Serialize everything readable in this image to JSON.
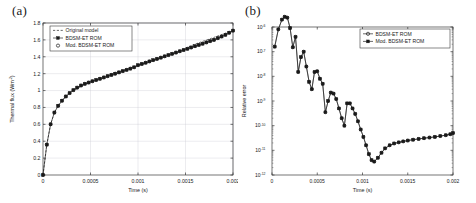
{
  "figure": {
    "panels": [
      {
        "id": "a",
        "label": "(a)",
        "xlabel": "Time (s)",
        "ylabel": "Thermal flux (Wm",
        "ylabel_sup": "-2",
        "ylabel_suffix": ")",
        "xticks": [
          "0",
          "0.0005",
          "0.001",
          "0.0015",
          "0.002"
        ],
        "yticks": [
          "0",
          "0.2",
          "0.4",
          "0.6",
          "0.8",
          "1",
          "1.2",
          "1.4",
          "1.6",
          "1.8"
        ],
        "legend": [
          {
            "label": "Original model",
            "marker": "none",
            "style": "dashed"
          },
          {
            "label": "BDSM-ET ROM",
            "marker": "square-filled",
            "style": "solid"
          },
          {
            "label": "Mod. BDSM-ET ROM",
            "marker": "circle-open",
            "style": "none"
          }
        ]
      },
      {
        "id": "b",
        "label": "(b)",
        "xlabel": "Time (s)",
        "ylabel": "Relative error",
        "xticks": [
          "0",
          "0.0005",
          "0.001",
          "0.0015",
          "0.002"
        ],
        "yticks": [
          "10",
          "10",
          "10",
          "10",
          "10",
          "10",
          "10"
        ],
        "yexps": [
          "-6",
          "-7",
          "-8",
          "-9",
          "-10",
          "-11",
          "-12"
        ],
        "legend": [
          {
            "label": "BDSM-ET ROM",
            "marker": "circle-open",
            "style": "solid"
          },
          {
            "label": "Mod. BDSM-ET ROM",
            "marker": "square-filled",
            "style": "solid"
          }
        ]
      }
    ]
  },
  "chart_data": [
    {
      "type": "line",
      "panel": "a",
      "title": "",
      "xlabel": "Time (s)",
      "ylabel": "Thermal flux (Wm^-2)",
      "xlim": [
        0,
        0.002
      ],
      "ylim": [
        0,
        1.8
      ],
      "grid": true,
      "legend_position": "top-left",
      "series": [
        {
          "name": "Original model",
          "marker": "none",
          "linestyle": "dashed",
          "x": [
            0,
            4e-05,
            8e-05,
            0.00012,
            0.00016,
            0.0002,
            0.00025,
            0.0003,
            0.00035,
            0.0004,
            0.00045,
            0.0005,
            0.0006,
            0.0007,
            0.0008,
            0.0009,
            0.001,
            0.0011,
            0.0012,
            0.0013,
            0.0014,
            0.0015,
            0.0016,
            0.0017,
            0.0018,
            0.0019,
            0.002
          ],
          "y": [
            0,
            0.36,
            0.6,
            0.74,
            0.82,
            0.88,
            0.94,
            0.99,
            1.02,
            1.05,
            1.08,
            1.1,
            1.15,
            1.19,
            1.23,
            1.26,
            1.3,
            1.33,
            1.37,
            1.41,
            1.45,
            1.5,
            1.55,
            1.59,
            1.63,
            1.67,
            1.71
          ]
        },
        {
          "name": "BDSM-ET ROM",
          "marker": "square-filled",
          "linestyle": "solid",
          "x": [
            0,
            4e-05,
            8e-05,
            0.00012,
            0.00016,
            0.0002,
            0.00024,
            0.00028,
            0.00032,
            0.00036,
            0.0004,
            0.00044,
            0.00048,
            0.00052,
            0.00056,
            0.0006,
            0.00064,
            0.00068,
            0.00072,
            0.00076,
            0.0008,
            0.00084,
            0.00088,
            0.00092,
            0.00096,
            0.001,
            0.00104,
            0.00108,
            0.00112,
            0.00116,
            0.0012,
            0.00124,
            0.00128,
            0.00132,
            0.00136,
            0.0014,
            0.00144,
            0.00148,
            0.00152,
            0.00156,
            0.0016,
            0.00164,
            0.00168,
            0.00172,
            0.00176,
            0.0018,
            0.00184,
            0.00188,
            0.00192,
            0.00196,
            0.002
          ],
          "y": [
            0,
            0.36,
            0.6,
            0.74,
            0.82,
            0.88,
            0.93,
            0.97,
            1.005,
            1.035,
            1.06,
            1.08,
            1.095,
            1.11,
            1.125,
            1.14,
            1.155,
            1.17,
            1.185,
            1.2,
            1.215,
            1.23,
            1.245,
            1.26,
            1.275,
            1.3,
            1.315,
            1.33,
            1.345,
            1.36,
            1.375,
            1.39,
            1.405,
            1.42,
            1.435,
            1.45,
            1.465,
            1.48,
            1.495,
            1.51,
            1.525,
            1.54,
            1.555,
            1.57,
            1.585,
            1.6,
            1.62,
            1.64,
            1.66,
            1.685,
            1.71
          ]
        },
        {
          "name": "Mod. BDSM-ET ROM",
          "marker": "circle-open",
          "linestyle": "none",
          "x": [
            0,
            4e-05,
            8e-05,
            0.00012,
            0.00016,
            0.0002,
            0.00024,
            0.00028,
            0.00032,
            0.00036,
            0.0004,
            0.00044,
            0.00048,
            0.00052,
            0.00056,
            0.0006,
            0.00064,
            0.00068,
            0.00072,
            0.00076,
            0.0008,
            0.00084,
            0.00088,
            0.00092,
            0.00096,
            0.001,
            0.00104,
            0.00108,
            0.00112,
            0.00116,
            0.0012,
            0.00124,
            0.00128,
            0.00132,
            0.00136,
            0.0014,
            0.00144,
            0.00148,
            0.00152,
            0.00156,
            0.0016,
            0.00164,
            0.00168,
            0.00172,
            0.00176,
            0.0018,
            0.00184,
            0.00188,
            0.00192,
            0.00196,
            0.002
          ],
          "y": [
            0,
            0.36,
            0.6,
            0.74,
            0.82,
            0.88,
            0.93,
            0.97,
            1.005,
            1.035,
            1.06,
            1.08,
            1.095,
            1.11,
            1.125,
            1.14,
            1.155,
            1.17,
            1.185,
            1.2,
            1.215,
            1.23,
            1.245,
            1.26,
            1.275,
            1.3,
            1.315,
            1.33,
            1.345,
            1.36,
            1.375,
            1.39,
            1.405,
            1.42,
            1.435,
            1.45,
            1.465,
            1.48,
            1.495,
            1.51,
            1.525,
            1.54,
            1.555,
            1.57,
            1.585,
            1.6,
            1.62,
            1.64,
            1.66,
            1.685,
            1.71
          ]
        }
      ]
    },
    {
      "type": "line",
      "panel": "b",
      "title": "",
      "xlabel": "Time (s)",
      "ylabel": "Relative error",
      "xlim": [
        0,
        0.002
      ],
      "ylim": [
        1e-12,
        1e-06
      ],
      "yscale": "log",
      "grid": false,
      "legend_position": "top-right",
      "series": [
        {
          "name": "BDSM-ET ROM",
          "marker": "circle-open",
          "linestyle": "solid",
          "x": [
            3e-05,
            7e-05,
            0.00011,
            0.00014,
            0.00017,
            0.0002,
            0.00023,
            0.00026,
            0.00029,
            0.00032,
            0.00035,
            0.00038,
            0.00041,
            0.00044,
            0.00047,
            0.0005,
            0.00053,
            0.00056,
            0.00059,
            0.00062,
            0.00065,
            0.00068,
            0.00071,
            0.00074,
            0.00077,
            0.0008,
            0.00083,
            0.00086,
            0.00089,
            0.00092,
            0.00095,
            0.00098,
            0.00101,
            0.00104,
            0.00107,
            0.0011,
            0.00113,
            0.00117,
            0.00121,
            0.00125,
            0.0013,
            0.00135,
            0.0014,
            0.00145,
            0.0015,
            0.00156,
            0.00162,
            0.00168,
            0.00174,
            0.0018,
            0.00186,
            0.00192,
            0.00197,
            0.002
          ],
          "y": [
            1.6e-07,
            8e-07,
            2e-06,
            2.6e-06,
            2.4e-06,
            9e-07,
            1.5e-07,
            4e-07,
            1.5e-08,
            6e-08,
            1e-07,
            2.5e-08,
            6e-09,
            3e-09,
            1.5e-08,
            1.6e-08,
            8e-09,
            5e-09,
            3.5e-10,
            1e-09,
            2.2e-09,
            2e-09,
            1.2e-09,
            5e-10,
            2e-10,
            1e-10,
            8e-10,
            8e-10,
            5e-10,
            3e-10,
            1.5e-10,
            7e-11,
            3.5e-11,
            1.6e-11,
            7e-12,
            4e-12,
            3.5e-12,
            5e-12,
            8e-12,
            1.2e-11,
            1.6e-11,
            1.9e-11,
            2.1e-11,
            2.3e-11,
            2.5e-11,
            2.7e-11,
            2.9e-11,
            3.1e-11,
            3.3e-11,
            3.5e-11,
            3.8e-11,
            4.1e-11,
            4.5e-11,
            5e-11
          ]
        },
        {
          "name": "Mod. BDSM-ET ROM",
          "marker": "square-filled",
          "linestyle": "solid",
          "x": [
            3e-05,
            7e-05,
            0.00011,
            0.00014,
            0.00017,
            0.0002,
            0.00023,
            0.00026,
            0.00029,
            0.00032,
            0.00035,
            0.00038,
            0.00041,
            0.00044,
            0.00047,
            0.0005,
            0.00053,
            0.00056,
            0.00059,
            0.00062,
            0.00065,
            0.00068,
            0.00071,
            0.00074,
            0.00077,
            0.0008,
            0.00083,
            0.00086,
            0.00089,
            0.00092,
            0.00095,
            0.00098,
            0.00101,
            0.00104,
            0.00107,
            0.0011,
            0.00113,
            0.00117,
            0.00121,
            0.00125,
            0.0013,
            0.00135,
            0.0014,
            0.00145,
            0.0015,
            0.00156,
            0.00162,
            0.00168,
            0.00174,
            0.0018,
            0.00186,
            0.00192,
            0.00197,
            0.002
          ],
          "y": [
            1.6e-07,
            8e-07,
            2e-06,
            2.6e-06,
            2.4e-06,
            9e-07,
            1.5e-07,
            4e-07,
            1.5e-08,
            6e-08,
            1e-07,
            2.5e-08,
            6e-09,
            3e-09,
            1.5e-08,
            1.6e-08,
            8e-09,
            5e-09,
            3.5e-10,
            1e-09,
            2.2e-09,
            2e-09,
            1.2e-09,
            5e-10,
            2e-10,
            1e-10,
            8e-10,
            8e-10,
            5e-10,
            3e-10,
            1.5e-10,
            7e-11,
            3.5e-11,
            1.6e-11,
            7e-12,
            4e-12,
            3.5e-12,
            5e-12,
            8e-12,
            1.2e-11,
            1.6e-11,
            1.9e-11,
            2.1e-11,
            2.3e-11,
            2.5e-11,
            2.7e-11,
            2.9e-11,
            3.1e-11,
            3.3e-11,
            3.5e-11,
            3.8e-11,
            4.1e-11,
            4.5e-11,
            5e-11
          ]
        }
      ]
    }
  ]
}
